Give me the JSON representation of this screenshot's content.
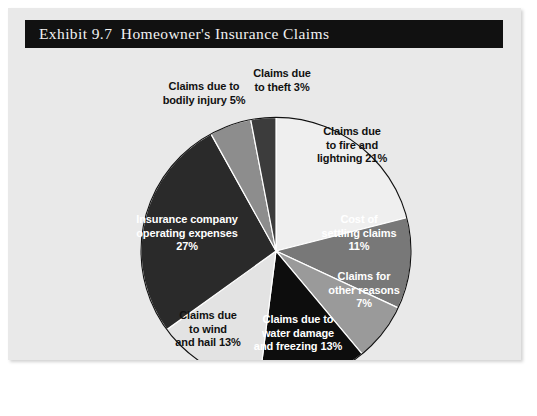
{
  "figure": {
    "title": "Exhibit 9.7  Homeowner's Insurance Claims",
    "background_color": "#e9e9e9",
    "title_bar_color": "#111111",
    "title_text_color": "#f2f2f2"
  },
  "chart_data": {
    "type": "pie",
    "title": "Exhibit 9.7  Homeowner's Insurance Claims",
    "xlabel": "",
    "ylabel": "",
    "legend": "none",
    "grid": false,
    "start_angle_deg": 0,
    "direction": "clockwise",
    "categories": [
      "Claims due to fire and lightning",
      "Cost of settling claims",
      "Claims for other reasons",
      "Claims due to water damage and freezing",
      "Claims due to wind and hail",
      "Insurance company operating expenses",
      "Claims due to bodily injury",
      "Claims due to theft"
    ],
    "values": [
      21,
      11,
      7,
      13,
      13,
      27,
      5,
      3
    ],
    "units": "percent",
    "total": 100,
    "colors": [
      "#efefef",
      "#787878",
      "#9a9a9a",
      "#0d0d0d",
      "#e3e3e3",
      "#2a2a2a",
      "#8d8d8d",
      "#3c3c3c"
    ],
    "slices": [
      {
        "name": "fire-and-lightning",
        "label": "Claims due\nto fire and\nlightning 21%",
        "value": 21,
        "color": "#efefef",
        "text_color": "#111111",
        "label_x": 289,
        "label_y": 117,
        "label_width": 110
      },
      {
        "name": "cost-of-settling-claims",
        "label": "Cost of\nsettling claims\n11%",
        "value": 11,
        "color": "#787878",
        "text_color": "#ffffff",
        "label_x": 292,
        "label_y": 205,
        "label_width": 118
      },
      {
        "name": "other-reasons",
        "label": "Claims for\nother reasons\n7%",
        "value": 7,
        "color": "#9a9a9a",
        "text_color": "#ffffff",
        "label_x": 297,
        "label_y": 262,
        "label_width": 118
      },
      {
        "name": "water-damage-and-freezing",
        "label": "Claims due to\nwater damage\nand freezing 13%",
        "value": 13,
        "color": "#0d0d0d",
        "text_color": "#ffffff",
        "label_x": 225,
        "label_y": 305,
        "label_width": 130
      },
      {
        "name": "wind-and-hail",
        "label": "Claims due\nto wind\nand hail 13%",
        "value": 13,
        "color": "#e3e3e3",
        "text_color": "#111111",
        "label_x": 148,
        "label_y": 301,
        "label_width": 104
      },
      {
        "name": "operating-expenses",
        "label": "Insurance company\noperating expenses\n27%",
        "value": 27,
        "color": "#2a2a2a",
        "text_color": "#ffffff",
        "label_x": 109,
        "label_y": 205,
        "label_width": 140
      },
      {
        "name": "bodily-injury",
        "label": "Claims due to\nbodily injury 5%",
        "value": 5,
        "color": "#8d8d8d",
        "text_color": "#111111",
        "label_x": 137,
        "label_y": 72,
        "label_width": 118
      },
      {
        "name": "theft",
        "label": "Claims due\nto theft 3%",
        "value": 3,
        "color": "#3c3c3c",
        "text_color": "#111111",
        "label_x": 228,
        "label_y": 59,
        "label_width": 92
      }
    ],
    "geometry": {
      "center_x": 268,
      "center_y": 243,
      "radius": 135,
      "outline_color": "#111111"
    }
  }
}
